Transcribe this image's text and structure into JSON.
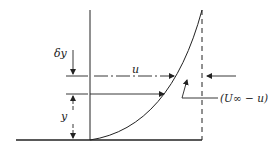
{
  "diagram": {
    "labels": {
      "delta_y": "δy",
      "u": "u",
      "y": "y",
      "velocity_deficit": "(U∞ − u)"
    },
    "colors": {
      "ink": "#222222",
      "background": "#ffffff"
    }
  }
}
